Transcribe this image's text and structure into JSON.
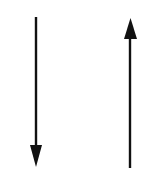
{
  "diagram": {
    "background": "#ffffff",
    "stroke_color": "#111111",
    "arrows": [
      {
        "name": "down-arrow",
        "direction": "down",
        "x": 36,
        "y_start": 17,
        "y_end": 167
      },
      {
        "name": "up-arrow",
        "direction": "up",
        "x": 130,
        "y_start": 168,
        "y_end": 18
      }
    ]
  }
}
